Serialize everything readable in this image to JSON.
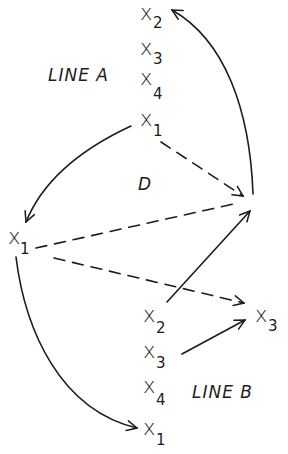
{
  "diagram": {
    "line_a": {
      "label": "LINE A",
      "nodes": [
        {
          "var": "x",
          "sub": "2"
        },
        {
          "var": "x",
          "sub": "3"
        },
        {
          "var": "x",
          "sub": "4"
        },
        {
          "var": "x",
          "sub": "1"
        }
      ]
    },
    "line_b": {
      "label": "LINE B",
      "nodes": [
        {
          "var": "x",
          "sub": "2"
        },
        {
          "var": "x",
          "sub": "3"
        },
        {
          "var": "x",
          "sub": "4"
        },
        {
          "var": "x",
          "sub": "1"
        }
      ]
    },
    "left_node": {
      "var": "x",
      "sub": "1"
    },
    "right_node": {
      "var": "x",
      "sub": "3"
    },
    "region_label": "D",
    "edges": [
      {
        "from": "line_a.x1",
        "to": "left.x1",
        "style": "solid"
      },
      {
        "from": "line_a.x1",
        "to": "junction",
        "style": "dashed"
      },
      {
        "from": "junction",
        "to": "line_a.x2",
        "style": "solid"
      },
      {
        "from": "left.x1",
        "to": "junction",
        "style": "dashed"
      },
      {
        "from": "left.x1",
        "to": "right.x3",
        "style": "dashed"
      },
      {
        "from": "line_b.x2",
        "to": "junction",
        "style": "solid"
      },
      {
        "from": "line_b.x3",
        "to": "right.x3",
        "style": "solid"
      },
      {
        "from": "left.x1",
        "to": "line_b.x1",
        "style": "solid"
      }
    ],
    "colors": {
      "ink": "#1c1c1c",
      "paper": "#ffffff"
    }
  }
}
